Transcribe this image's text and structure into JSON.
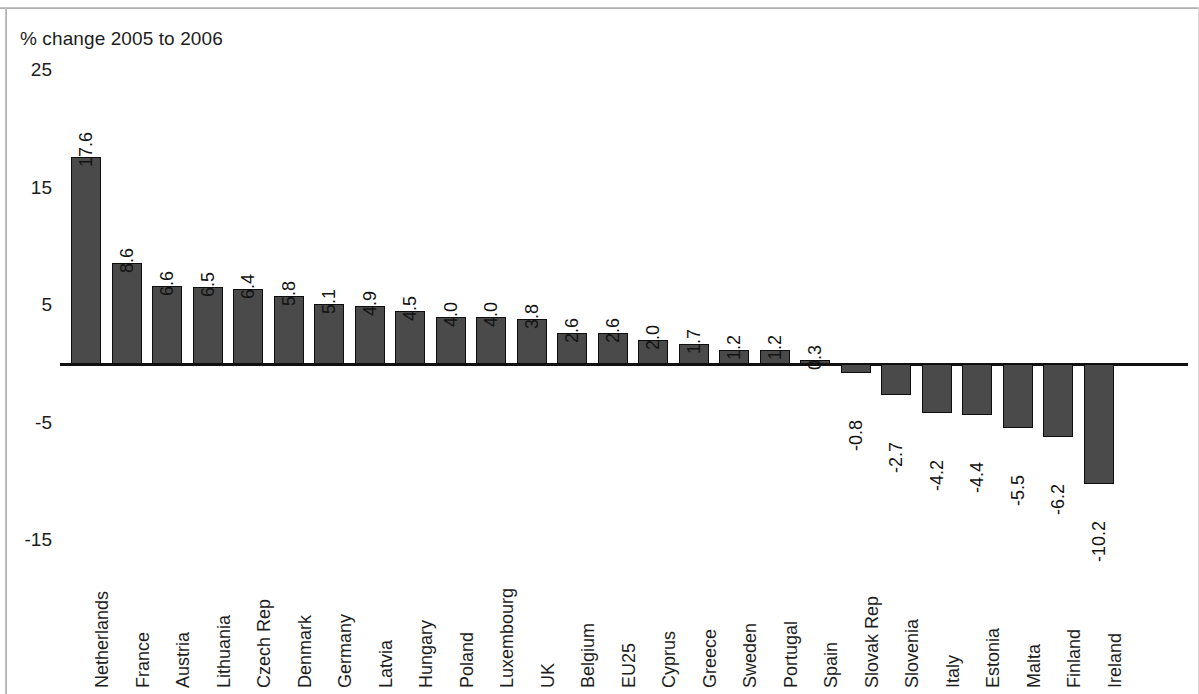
{
  "page": {
    "background_color": "#ffffff",
    "frame_color": "#b5b5b5"
  },
  "chart_data": {
    "type": "bar",
    "title": "% change 2005 to 2006",
    "subtitle": "",
    "xlabel": "",
    "ylabel": "",
    "ylim": [
      -15,
      25
    ],
    "yticks": [
      25,
      15,
      5,
      -5,
      -15
    ],
    "ytick_labels": [
      "25",
      "15",
      "5",
      "-5",
      "-15"
    ],
    "grid": false,
    "legend": null,
    "bar_color": "#4a4a4a",
    "bar_edge_color": "#0d0d0d",
    "zero_line_color": "#111111",
    "orientation": "vertical",
    "data_labels_rotated": true,
    "categories": [
      "Netherlands",
      "France",
      "Austria",
      "Lithuania",
      "Czech Rep",
      "Denmark",
      "Germany",
      "Latvia",
      "Hungary",
      "Poland",
      "Luxembourg",
      "UK",
      "Belgium",
      "EU25",
      "Cyprus",
      "Greece",
      "Sweden",
      "Portugal",
      "Spain",
      "Slovak Rep",
      "Slovenia",
      "Italy",
      "Estonia",
      "Malta",
      "Finland",
      "Ireland"
    ],
    "values": [
      17.6,
      8.6,
      6.6,
      6.5,
      6.4,
      5.8,
      5.1,
      4.9,
      4.5,
      4.0,
      4.0,
      3.8,
      2.6,
      2.6,
      2.0,
      1.7,
      1.2,
      1.2,
      0.3,
      -0.8,
      -2.7,
      -4.2,
      -4.4,
      -5.5,
      -6.2,
      -10.2
    ],
    "value_labels": [
      "17.6",
      "8.6",
      "6.6",
      "6.5",
      "6.4",
      "5.8",
      "5.1",
      "4.9",
      "4.5",
      "4.0",
      "4.0",
      "3.8",
      "2.6",
      "2.6",
      "2.0",
      "1.7",
      "1.2",
      "1.2",
      "0.3",
      "-0.8",
      "-2.7",
      "-4.2",
      "-4.4",
      "-5.5",
      "-6.2",
      "-10.2"
    ]
  }
}
